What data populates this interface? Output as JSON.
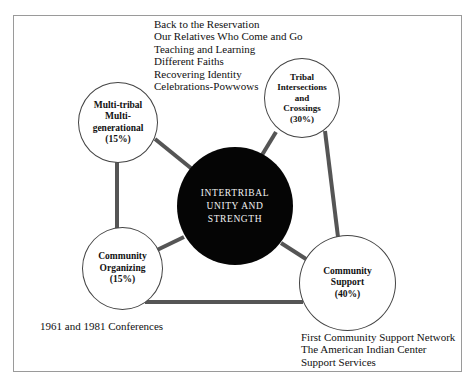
{
  "diagram": {
    "center": {
      "label": "INTERTRIBAL\nUNITY AND\nSTRENGTH",
      "fill": "#050505"
    },
    "nodes": [
      {
        "id": "multi-tribal",
        "label": "Multi-tribal\nMulti-\ngenerational\n(15%)",
        "percent": "15%"
      },
      {
        "id": "tribal-intersections",
        "label": "Tribal\nIntersections\nand\nCrossings\n(30%)",
        "percent": "30%"
      },
      {
        "id": "community-organizing",
        "label": "Community\nOrganizing\n(15%)",
        "percent": "15%"
      },
      {
        "id": "community-support",
        "label": "Community\nSupport\n(40%)",
        "percent": "40%"
      }
    ],
    "annotations": {
      "top_list": [
        "Back to the Reservation",
        "Our Relatives Who Come and Go",
        "Teaching and Learning",
        "Different Faiths",
        "Recovering Identity",
        "Celebrations-Powwows"
      ],
      "bottom_left": [
        "1961 and 1981 Conferences"
      ],
      "bottom_right": [
        "First Community Support Network",
        "The American Indian Center",
        "Support Services"
      ]
    },
    "colors": {
      "connector": "#555555",
      "frame_border": "#9a9a9a",
      "node_border": "#444444"
    }
  }
}
